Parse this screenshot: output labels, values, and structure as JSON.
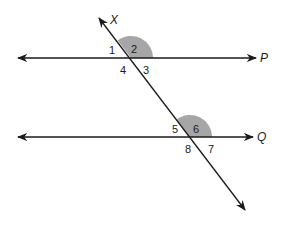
{
  "diagram": {
    "lines": {
      "P": {
        "label": "P"
      },
      "Q": {
        "label": "Q"
      },
      "transversal": {
        "label": "X"
      }
    },
    "angles_top": [
      "1",
      "2",
      "3",
      "4"
    ],
    "angles_bottom": [
      "5",
      "6",
      "7",
      "8"
    ],
    "shaded_angles": [
      "2",
      "6"
    ],
    "colors": {
      "line": "#1a1a1a",
      "shade": "#a6a6a6",
      "background": "#ffffff"
    }
  }
}
